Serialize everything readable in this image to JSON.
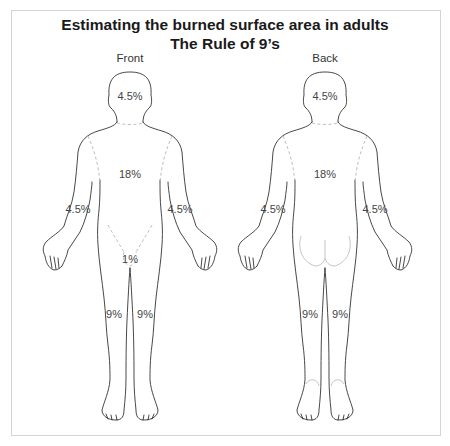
{
  "title": {
    "line1": "Estimating the burned surface area in adults",
    "line2": "The Rule of 9’s"
  },
  "views": [
    {
      "label": "Front",
      "regions": {
        "head": "4.5%",
        "trunk": "18%",
        "left_arm": "4.5%",
        "right_arm": "4.5%",
        "genitals": "1%",
        "left_leg": "9%",
        "right_leg": "9%"
      }
    },
    {
      "label": "Back",
      "regions": {
        "head": "4.5%",
        "trunk": "18%",
        "left_arm": "4.5%",
        "right_arm": "4.5%",
        "left_leg": "9%",
        "right_leg": "9%"
      }
    }
  ],
  "colors": {
    "outline": "#333333",
    "dashed_divider": "#b5b5b5",
    "frame_border": "#d4d4d4",
    "title_text": "#1a1a1a"
  }
}
